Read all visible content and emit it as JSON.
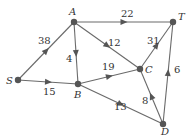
{
  "diagram": {
    "type": "directed-weighted-graph",
    "nodes": [
      {
        "id": "S",
        "label": "S",
        "x": 18,
        "y": 80,
        "lx": 6,
        "ly": 84
      },
      {
        "id": "A",
        "label": "A",
        "x": 74,
        "y": 22,
        "lx": 69,
        "ly": 15
      },
      {
        "id": "B",
        "label": "B",
        "x": 78,
        "y": 84,
        "lx": 74,
        "ly": 98
      },
      {
        "id": "C",
        "label": "C",
        "x": 140,
        "y": 69,
        "lx": 145,
        "ly": 73
      },
      {
        "id": "D",
        "label": "D",
        "x": 163,
        "y": 124,
        "lx": 161,
        "ly": 135
      },
      {
        "id": "T",
        "label": "T",
        "x": 173,
        "y": 22,
        "lx": 178,
        "ly": 20
      }
    ],
    "edges": [
      {
        "from": "S",
        "to": "A",
        "weight": "38",
        "lx": 38,
        "ly": 44
      },
      {
        "from": "S",
        "to": "B",
        "weight": "15",
        "lx": 43,
        "ly": 95
      },
      {
        "from": "A",
        "to": "B",
        "weight": "4",
        "lx": 66,
        "ly": 62
      },
      {
        "from": "A",
        "to": "T",
        "weight": "22",
        "lx": 121,
        "ly": 17
      },
      {
        "from": "A",
        "to": "C",
        "weight": "12",
        "lx": 108,
        "ly": 46
      },
      {
        "from": "B",
        "to": "C",
        "weight": "19",
        "lx": 102,
        "ly": 70
      },
      {
        "from": "B",
        "to": "D",
        "weight": "13",
        "lx": 114,
        "ly": 110
      },
      {
        "from": "C",
        "to": "T",
        "weight": "31",
        "lx": 147,
        "ly": 44
      },
      {
        "from": "D",
        "to": "C",
        "weight": "8",
        "lx": 142,
        "ly": 104
      },
      {
        "from": "D",
        "to": "T",
        "weight": "6",
        "lx": 174,
        "ly": 73
      }
    ]
  }
}
